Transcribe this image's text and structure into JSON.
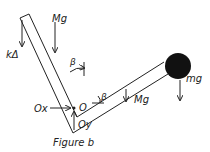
{
  "figure": {
    "caption": "Figure b"
  },
  "labels": {
    "spring_force": "kΔ",
    "arm_weight_upper": "Mg",
    "arm_weight_lower": "Mg",
    "ball_weight": "mg",
    "angle_upper": "β",
    "angle_lower": "β",
    "pivot": "O",
    "reaction_x": "Ox",
    "reaction_y": "Oy"
  },
  "colors": {
    "ink": "#222222",
    "ball": "#111111",
    "background": "#ffffff"
  }
}
